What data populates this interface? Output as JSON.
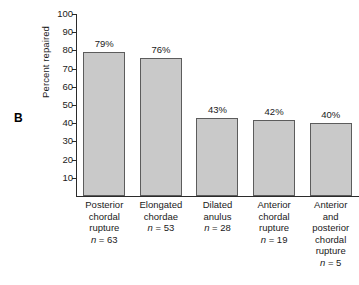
{
  "panel": {
    "letter": "B"
  },
  "chart_data": {
    "type": "bar",
    "title": "",
    "xlabel": "",
    "ylabel": "Percent repaired",
    "ylim": [
      0,
      100
    ],
    "ytick_step": 10,
    "yticks": [
      10,
      20,
      30,
      40,
      50,
      60,
      70,
      80,
      90,
      100
    ],
    "ytick_labels": [
      "10",
      "20",
      "30",
      "40",
      "50",
      "60",
      "70",
      "80",
      "90",
      "100"
    ],
    "grid": false,
    "legend": null,
    "bar_color": "#c9c9c9",
    "bar_edge_color": "#5c5c5c",
    "axis_color": "#2b2b2b",
    "categories": [
      "Posterior chordal rupture",
      "Elongated chordae",
      "Dilated anulus",
      "Anterior chordal rupture",
      "Anterior and posterior chordal rupture"
    ],
    "values": [
      79,
      76,
      43,
      42,
      40
    ],
    "data_labels": [
      "79%",
      "76%",
      "43%",
      "42%",
      "40%"
    ],
    "counts": [
      63,
      53,
      28,
      19,
      5
    ],
    "count_labels": [
      "n = 63",
      "n = 53",
      "n = 28",
      "n = 19",
      "n = 5"
    ],
    "bars": [
      {
        "value": 79,
        "data_label": "79%",
        "category_lines": [
          "Posterior",
          "chordal",
          "rupture"
        ],
        "count_prefix": "n",
        "count_text": " = 63"
      },
      {
        "value": 76,
        "data_label": "76%",
        "category_lines": [
          "Elongated",
          "chordae"
        ],
        "count_prefix": "n",
        "count_text": " = 53"
      },
      {
        "value": 43,
        "data_label": "43%",
        "category_lines": [
          "Dilated",
          "anulus"
        ],
        "count_prefix": "n",
        "count_text": " = 28"
      },
      {
        "value": 42,
        "data_label": "42%",
        "category_lines": [
          "Anterior",
          "chordal",
          "rupture"
        ],
        "count_prefix": "n",
        "count_text": " = 19"
      },
      {
        "value": 40,
        "data_label": "40%",
        "category_lines": [
          "Anterior",
          "and",
          "posterior",
          "chordal",
          "rupture"
        ],
        "count_prefix": "n",
        "count_text": " = 5"
      }
    ]
  }
}
